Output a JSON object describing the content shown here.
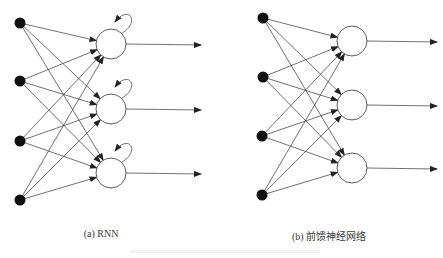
{
  "figure": {
    "panels": [
      {
        "id": "rnn",
        "caption": "(a) RNN",
        "caption_x": 101,
        "caption_y": 228,
        "recurrent": true,
        "inputs": [
          [
            20,
            23
          ],
          [
            20,
            81
          ],
          [
            20,
            141
          ],
          [
            20,
            200
          ]
        ],
        "hidden": [
          [
            111,
            44
          ],
          [
            111,
            109
          ],
          [
            111,
            173
          ]
        ],
        "hidden_radius": 15,
        "output_end_x": 201
      },
      {
        "id": "feedforward",
        "caption": "(b) 前馈神经网络",
        "caption_x": 329,
        "caption_y": 228,
        "recurrent": false,
        "inputs": [
          [
            263,
            18
          ],
          [
            263,
            77
          ],
          [
            262,
            136
          ],
          [
            262,
            195
          ]
        ],
        "hidden": [
          [
            352,
            41
          ],
          [
            352,
            105
          ],
          [
            352,
            168
          ]
        ],
        "hidden_radius": 15,
        "output_end_x": 437
      }
    ],
    "colors": {
      "stroke": "#333333",
      "input_fill": "#111111",
      "hidden_fill": "#ffffff"
    }
  }
}
